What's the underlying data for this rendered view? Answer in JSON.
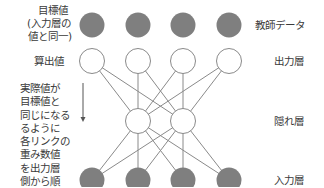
{
  "diagram": {
    "type": "neural-network-backpropagation",
    "left_labels": {
      "target": [
        "目標値",
        "(入力層の",
        "値と同一)"
      ],
      "computed": "算出値",
      "explanation": [
        "実際値が",
        "目標値と",
        "同じになる",
        "るように",
        "各リンクの",
        "重み数値",
        "を出力層",
        "側から順",
        "に修正する"
      ]
    },
    "right_labels": {
      "teacher_data": "教師データ",
      "output_layer": "出力層",
      "hidden_layer": "隠れ層",
      "input_layer": "入力層"
    },
    "layers": {
      "target": {
        "count": 4,
        "fill": "#7f7f7f",
        "y": 25
      },
      "output": {
        "count": 4,
        "fill": "#ffffff",
        "y": 61
      },
      "hidden": {
        "count": 2,
        "fill": "#ffffff",
        "y": 121
      },
      "input": {
        "count": 4,
        "fill": "#7f7f7f",
        "y": 180
      }
    },
    "arrow": {
      "direction": "down"
    },
    "colors": {
      "filled_node": "#7f7f7f",
      "stroke": "#8a8a8a",
      "line": "#8a8a8a"
    }
  }
}
